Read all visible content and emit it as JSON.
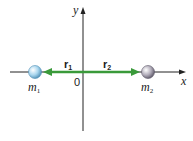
{
  "diagram": {
    "axes": {
      "x_label": "x",
      "y_label": "y",
      "origin_label": "0"
    },
    "vectors": [
      {
        "name": "r",
        "subscript": "1",
        "direction": "left",
        "color": "#3a9a3a"
      },
      {
        "name": "r",
        "subscript": "2",
        "direction": "right",
        "color": "#3a9a3a"
      }
    ],
    "masses": [
      {
        "name": "m",
        "subscript": "1",
        "color": "#a9d6ee",
        "position": "left"
      },
      {
        "name": "m",
        "subscript": "2",
        "color": "#b3aebb",
        "position": "right"
      }
    ],
    "colors": {
      "axis": "#222222",
      "vector": "#3a9a3a",
      "background": "#ffffff"
    }
  }
}
